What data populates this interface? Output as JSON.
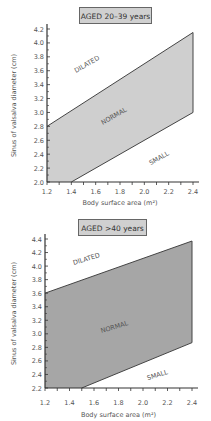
{
  "chart_data": [
    {
      "type": "area",
      "title": "AGED 20–39 years",
      "xlabel": "Body surface area (m²)",
      "ylabel": "Sinus of valsalva diameter (cm)",
      "xlim": [
        1.2,
        2.4
      ],
      "ylim": [
        2.0,
        4.2
      ],
      "xticks": [
        "1.2",
        "1.4",
        "1.6",
        "1.8",
        "2.0",
        "2.2",
        "2.4"
      ],
      "yticks": [
        "2.0",
        "2.2",
        "2.4",
        "2.6",
        "2.8",
        "3.0",
        "3.2",
        "3.4",
        "3.6",
        "3.8",
        "4.0",
        "4.2"
      ],
      "region_labels": [
        "DILATED",
        "NORMAL",
        "SMALL"
      ],
      "normal_band": {
        "upper": {
          "x": [
            1.2,
            2.4
          ],
          "y": [
            2.8,
            4.15
          ]
        },
        "lower": {
          "x": [
            1.4,
            2.4
          ],
          "y": [
            2.0,
            3.0
          ]
        }
      },
      "polygon": [
        [
          1.2,
          2.8
        ],
        [
          2.4,
          4.15
        ],
        [
          2.4,
          3.0
        ],
        [
          1.4,
          2.0
        ],
        [
          1.2,
          2.0
        ]
      ],
      "fill_color": "#cfcfcf"
    },
    {
      "type": "area",
      "title": "AGED >40 years",
      "xlabel": "Body surface area (m²)",
      "ylabel": "Sinus of valsalva diameter (cm)",
      "xlim": [
        1.2,
        2.4
      ],
      "ylim": [
        2.2,
        4.4
      ],
      "xticks": [
        "1.2",
        "1.4",
        "1.6",
        "1.8",
        "2.0",
        "2.2",
        "2.4"
      ],
      "yticks": [
        "2.2",
        "2.4",
        "2.6",
        "2.8",
        "3.0",
        "3.2",
        "3.4",
        "3.6",
        "3.8",
        "4.0",
        "4.2",
        "4.4"
      ],
      "region_labels": [
        "DILATED",
        "NORMAL",
        "SMALL"
      ],
      "normal_band": {
        "upper": {
          "x": [
            1.2,
            2.4
          ],
          "y": [
            3.6,
            4.37
          ]
        },
        "lower": {
          "x": [
            1.5,
            2.4
          ],
          "y": [
            2.2,
            2.87
          ]
        }
      },
      "polygon": [
        [
          1.2,
          3.6
        ],
        [
          2.4,
          4.37
        ],
        [
          2.4,
          2.87
        ],
        [
          1.5,
          2.2
        ],
        [
          1.2,
          2.2
        ]
      ],
      "fill_color": "#a6a6a6"
    }
  ]
}
